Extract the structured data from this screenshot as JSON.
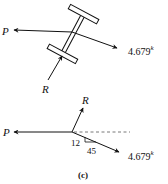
{
  "figure": {
    "caption": "(c)",
    "top_diagram": {
      "description": "Free body of I-beam member",
      "labels": {
        "p": "P",
        "r": "R",
        "force_value": "4.679",
        "force_unit": "k"
      }
    },
    "bottom_diagram": {
      "description": "Concurrent force vectors at joint",
      "labels": {
        "p": "P",
        "r": "R",
        "force_value": "4.679",
        "force_unit": "k",
        "slope_rise": "12",
        "slope_run": "45"
      }
    }
  }
}
